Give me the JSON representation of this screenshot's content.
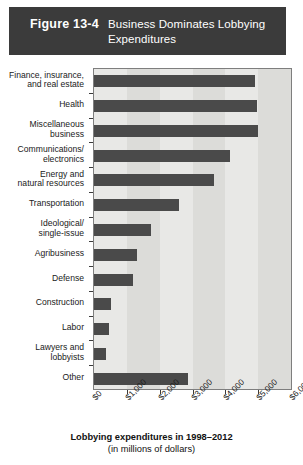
{
  "figure": {
    "number": "Figure 13-4",
    "title": "Business Dominates Lobbying Expenditures"
  },
  "axis_caption": {
    "line1": "Lobbying expenditures in 1998–2012",
    "line2": "(in millions of dollars)"
  },
  "colors": {
    "title_band": "#3b3b3b",
    "title_text": "#ffffff",
    "bar": "#4a4a4a",
    "plot_background": "#e8e8e6",
    "plot_band": "#dcdcd9",
    "frame": "#7e7e7e"
  },
  "chart_data": {
    "type": "bar",
    "orientation": "horizontal",
    "title": "Business Dominates Lobbying Expenditures",
    "xlabel": "Lobbying expenditures in 1998–2012 (in millions of dollars)",
    "ylabel": "",
    "xlim": [
      0,
      6000
    ],
    "xticks": [
      0,
      1000,
      2000,
      3000,
      4000,
      5000,
      6000
    ],
    "xtick_labels": [
      "$0",
      "$1,000",
      "$2,000",
      "$3,000",
      "$4,000",
      "$5,000",
      "$6,000"
    ],
    "grid": false,
    "banded_background": true,
    "legend": null,
    "categories": [
      "Finance, insurance, and real estate",
      "Health",
      "Miscellaneous business",
      "Communications/ electronics",
      "Energy and natural resources",
      "Transportation",
      "Ideological/ single-issue",
      "Agribusiness",
      "Defense",
      "Construction",
      "Labor",
      "Lawyers and lobbyists",
      "Other"
    ],
    "category_label_lines": [
      [
        "Finance, insurance,",
        "and real estate"
      ],
      [
        "Health"
      ],
      [
        "Miscellaneous",
        "business"
      ],
      [
        "Communications/",
        "electronics"
      ],
      [
        "Energy and",
        "natural resources"
      ],
      [
        "Transportation"
      ],
      [
        "Ideological/",
        "single-issue"
      ],
      [
        "Agribusiness"
      ],
      [
        "Defense"
      ],
      [
        "Construction"
      ],
      [
        "Labor"
      ],
      [
        "Lawyers and",
        "lobbyists"
      ],
      [
        "Other"
      ]
    ],
    "values": [
      4900,
      4950,
      5000,
      4150,
      3650,
      2600,
      1750,
      1300,
      1200,
      510,
      470,
      370,
      2850
    ]
  }
}
